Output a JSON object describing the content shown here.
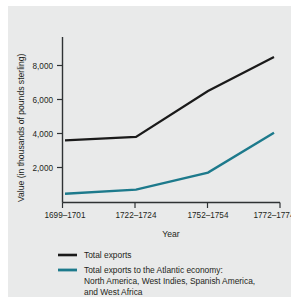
{
  "chart_data": {
    "type": "line",
    "title": "",
    "xlabel": "Year",
    "ylabel": "Value (in thousands of pounds sterling)",
    "categories": [
      "1699–1701",
      "1722–1724",
      "1752–1754",
      "1772–1774"
    ],
    "yticks": [
      "2,000",
      "4,000",
      "6,000",
      "8,000"
    ],
    "ytick_values": [
      2000,
      4000,
      6000,
      8000
    ],
    "ylim": [
      0,
      9200
    ],
    "grid": false,
    "legend_position": "bottom-left",
    "series": [
      {
        "name": "Total exports",
        "color": "#1a1a1a",
        "values": [
          3600,
          3800,
          6500,
          8500
        ]
      },
      {
        "name": "Total exports to the Atlantic economy: North America, West Indies, Spanish America, and West Africa",
        "color": "#1d7a8c",
        "values": [
          450,
          700,
          1700,
          4050
        ]
      }
    ]
  },
  "legend": {
    "entries": [
      {
        "label": "Total exports"
      },
      {
        "line1": "Total exports to the Atlantic economy:",
        "line2": "North America, West Indies, Spanish America,",
        "line3": "and West Africa"
      }
    ]
  },
  "axes": {
    "x_title": "Year",
    "y_title": "Value (in thousands of pounds sterling)",
    "x_labels": [
      "1699–1701",
      "1722–1724",
      "1752–1754",
      "1772–1774"
    ],
    "y_labels": [
      "8,000",
      "6,000",
      "4,000",
      "2,000"
    ]
  },
  "colors": {
    "panel_background": "#e9eaea",
    "axis": "#2f3234",
    "series_total_exports": "#1a1a1a",
    "series_atlantic": "#1d7a8c",
    "text": "#1d1f20"
  }
}
